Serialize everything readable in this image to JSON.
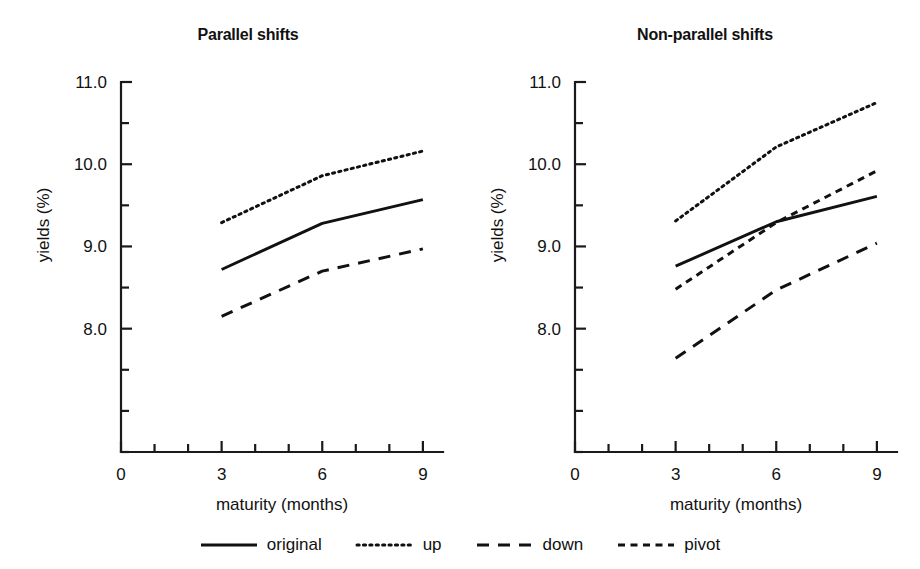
{
  "figure": {
    "width": 920,
    "height": 569,
    "background": "#ffffff",
    "ink": "#111111"
  },
  "legend": {
    "position": "bottom-center",
    "items": [
      {
        "label": "original",
        "style": "solid",
        "swatch": "legend-line-solid"
      },
      {
        "label": "up",
        "style": "dotted",
        "swatch": "legend-line-dotted"
      },
      {
        "label": "down",
        "style": "dashed",
        "swatch": "legend-line-dashed"
      },
      {
        "label": "pivot",
        "style": "shortdash",
        "swatch": "legend-line-shortdash"
      }
    ]
  },
  "chart_data": [
    {
      "type": "line",
      "title": "Parallel shifts",
      "xlabel": "maturity (months)",
      "ylabel": "yields (%)",
      "xlim": [
        0,
        9.6
      ],
      "ylim": [
        6.5,
        11.0
      ],
      "grid": false,
      "x": [
        3,
        6,
        9
      ],
      "xticks": [
        0,
        1,
        2,
        3,
        4,
        5,
        6,
        7,
        8,
        9
      ],
      "xticklabels": [
        "0",
        "",
        "",
        "3",
        "",
        "",
        "6",
        "",
        "",
        "9"
      ],
      "yticks": [
        6.5,
        7.0,
        7.5,
        8.0,
        8.5,
        9.0,
        9.5,
        10.0,
        10.5,
        11.0
      ],
      "yticklabels": [
        "",
        "",
        "",
        "8.0",
        "",
        "9.0",
        "",
        "10.0",
        "",
        "11.0"
      ],
      "series": [
        {
          "name": "original",
          "style": "solid",
          "values": [
            8.72,
            9.28,
            9.57
          ]
        },
        {
          "name": "up",
          "style": "dotted",
          "values": [
            9.29,
            9.86,
            10.16
          ]
        },
        {
          "name": "down",
          "style": "dashed",
          "values": [
            8.15,
            8.7,
            8.97
          ]
        }
      ]
    },
    {
      "type": "line",
      "title": "Non-parallel shifts",
      "xlabel": "maturity (months)",
      "ylabel": "yields (%)",
      "xlim": [
        0,
        9.6
      ],
      "ylim": [
        6.5,
        11.0
      ],
      "grid": false,
      "x": [
        3,
        6,
        9
      ],
      "xticks": [
        0,
        1,
        2,
        3,
        4,
        5,
        6,
        7,
        8,
        9
      ],
      "xticklabels": [
        "0",
        "",
        "",
        "3",
        "",
        "",
        "6",
        "",
        "",
        "9"
      ],
      "yticks": [
        6.5,
        7.0,
        7.5,
        8.0,
        8.5,
        9.0,
        9.5,
        10.0,
        10.5,
        11.0
      ],
      "yticklabels": [
        "",
        "",
        "",
        "8.0",
        "",
        "9.0",
        "",
        "10.0",
        "",
        "11.0"
      ],
      "series": [
        {
          "name": "original",
          "style": "solid",
          "values": [
            8.76,
            9.3,
            9.61
          ]
        },
        {
          "name": "up",
          "style": "dotted",
          "values": [
            9.31,
            10.21,
            10.75
          ]
        },
        {
          "name": "down",
          "style": "dashed",
          "values": [
            7.64,
            8.47,
            9.04
          ]
        },
        {
          "name": "pivot",
          "style": "shortdash",
          "values": [
            8.48,
            9.29,
            9.92
          ]
        }
      ]
    }
  ]
}
